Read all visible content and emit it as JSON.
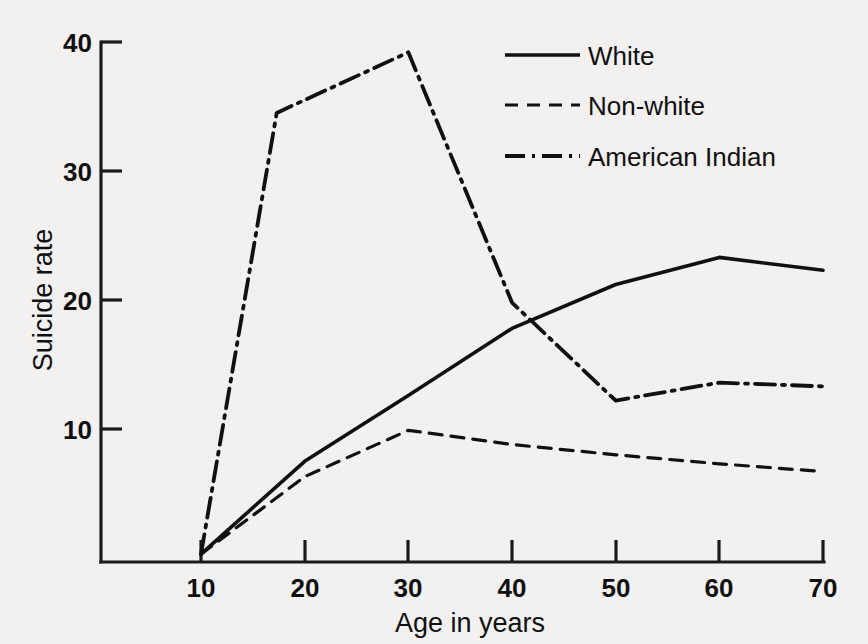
{
  "chart_data": {
    "type": "line",
    "title": "",
    "xlabel": "Age in years",
    "ylabel": "Suicide rate",
    "xlim": [
      5,
      72
    ],
    "ylim": [
      0,
      41
    ],
    "xticks": [
      10,
      20,
      30,
      40,
      50,
      60,
      70
    ],
    "xtick_labels": [
      "10",
      "20",
      "30",
      "40",
      "50",
      "60",
      "70"
    ],
    "yticks": [
      10,
      20,
      30,
      40
    ],
    "ytick_labels": [
      "10",
      "20",
      "30",
      "40"
    ],
    "grid": false,
    "legend_position": "upper right",
    "series": [
      {
        "name": "White",
        "style": "solid",
        "x": [
          10,
          20,
          30,
          40,
          50,
          60,
          70
        ],
        "values": [
          0.3,
          7.5,
          12.6,
          17.8,
          21.2,
          23.3,
          22.3
        ]
      },
      {
        "name": "Non-white",
        "style": "dashed",
        "x": [
          10,
          20,
          30,
          40,
          50,
          60,
          70
        ],
        "values": [
          0.3,
          6.3,
          9.9,
          8.8,
          8.0,
          7.3,
          6.7
        ]
      },
      {
        "name": "American Indian",
        "style": "dash-dot",
        "x": [
          10,
          17.3,
          30,
          40,
          50,
          60,
          70
        ],
        "values": [
          0.3,
          34.5,
          39.2,
          19.8,
          12.2,
          13.6,
          13.3
        ]
      }
    ]
  },
  "legend": {
    "items": [
      {
        "label": "White",
        "style": "solid"
      },
      {
        "label": "Non-white",
        "style": "dashed"
      },
      {
        "label": "American Indian",
        "style": "dash-dot"
      }
    ]
  },
  "colors": {
    "ink": "#111111",
    "paper": "#f3f2f0"
  }
}
